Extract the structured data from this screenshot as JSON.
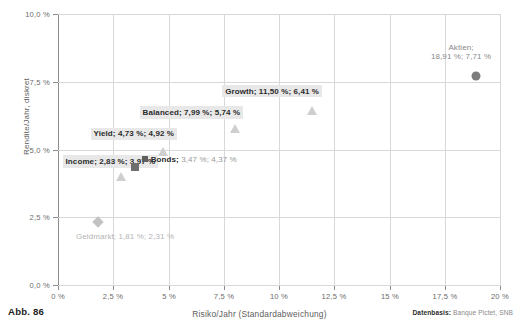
{
  "figure": {
    "number_label": "Abb. 86",
    "source_prefix": "Datenbasis:",
    "source_text": " Banque Pictet, SNB"
  },
  "chart_data": {
    "type": "scatter",
    "title": "",
    "xlabel": "Risiko/Jahr (Standardabweichung)",
    "ylabel": "Rendite/Jahr, diskret",
    "xlim": [
      0,
      20
    ],
    "ylim": [
      0,
      10
    ],
    "grid": true,
    "legend": "none",
    "xticks": [
      "0 %",
      "2,5 %",
      "5 %",
      "7,5 %",
      "10 %",
      "12,5 %",
      "15 %",
      "17,5 %",
      "20 %"
    ],
    "xtick_values": [
      0,
      2.5,
      5,
      7.5,
      10,
      12.5,
      15,
      17.5,
      20
    ],
    "yticks": [
      "0,0 %",
      "2,5 %",
      "5,0 %",
      "7,5 %",
      "10,0 %"
    ],
    "ytick_values": [
      0,
      2.5,
      5,
      7.5,
      10
    ],
    "points": [
      {
        "name": "Geldmarkt",
        "x": 1.81,
        "y": 2.31,
        "marker": "diamond",
        "color": "#c2c2c2",
        "label": "Geldmarkt; 1,81 %; 2,31 %",
        "label_style": "plain"
      },
      {
        "name": "Income",
        "x": 2.83,
        "y": 3.97,
        "marker": "triangle",
        "color": "#cfcfcf",
        "label": "Income; 2,83 %; 3,97 %",
        "label_style": "boxed"
      },
      {
        "name": "Bonds",
        "x": 3.47,
        "y": 4.37,
        "marker": "square",
        "color": "#6e6e6e",
        "label_bold": "Bonds;",
        "label_grey": " 3,47 %; 4,37 %",
        "label_style": "mixed"
      },
      {
        "name": "Yield",
        "x": 4.73,
        "y": 4.92,
        "marker": "triangle",
        "color": "#cfcfcf",
        "label": "Yield; 4,73 %; 4,92 %",
        "label_style": "boxed"
      },
      {
        "name": "Balanced",
        "x": 7.99,
        "y": 5.74,
        "marker": "triangle",
        "color": "#cfcfcf",
        "label": "Balanced; 7,99 %; 5,74 %",
        "label_style": "boxed"
      },
      {
        "name": "Growth",
        "x": 11.5,
        "y": 6.41,
        "marker": "triangle",
        "color": "#cfcfcf",
        "label": "Growth; 11,50 %; 6,41 %",
        "label_style": "boxed"
      },
      {
        "name": "Aktien",
        "x": 18.91,
        "y": 7.71,
        "marker": "circle",
        "color": "#7c7c7c",
        "label_line1": "Aktien;",
        "label_line2": "18,91 %; 7,71 %",
        "label_style": "light-two-line"
      }
    ]
  }
}
